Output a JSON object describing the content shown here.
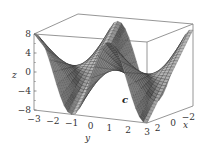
{
  "chart_data": {
    "type": "surface3d",
    "title": "",
    "panel_label": "c",
    "xlabel": "x",
    "ylabel": "y",
    "zlabel": "z",
    "x_ticks": [
      "2",
      "0",
      "−2"
    ],
    "y_ticks": [
      "−3",
      "−2",
      "−1",
      "0",
      "1",
      "2",
      "3"
    ],
    "z_ticks": [
      "8",
      "4",
      "0",
      "−4",
      "−8"
    ],
    "xlim": [
      -3,
      3
    ],
    "ylim": [
      -3,
      3
    ],
    "zlim": [
      -8,
      8
    ],
    "surface_function": "z = 2.7 * x * sin(1.6 * y)",
    "grid_resolution": 30,
    "colors": {
      "surface_light": "#c8c8c8",
      "surface_dark": "#2e2e2e",
      "mesh": "#1a1a1a",
      "box": "#8a8a8a"
    }
  },
  "labels": {
    "panel": "c",
    "x_axis": "x",
    "y_axis": "y",
    "z_axis": "z"
  }
}
